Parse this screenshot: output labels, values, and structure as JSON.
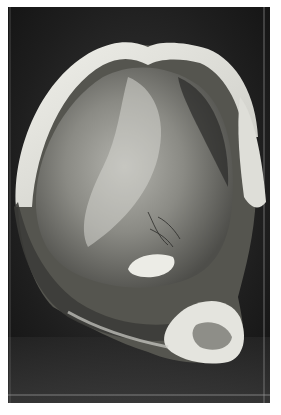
{
  "image": {
    "subject": "grayscale photograph of a preserved anatomical specimen (opened sac-like organ) in a display jar",
    "palette": {
      "background": "#ffffff",
      "jar_dark": "#1a1a1a",
      "jar_mid": "#3a3a3a",
      "tissue_light": "#e6e6e0",
      "tissue_mid": "#9a9a94",
      "tissue_dark": "#5a5a56"
    }
  }
}
